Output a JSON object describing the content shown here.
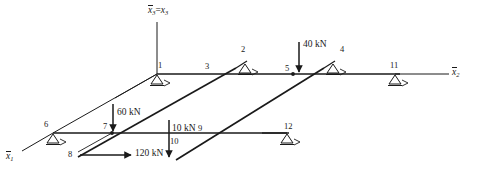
{
  "figure": {
    "type": "structural-frame-diagram",
    "background_color": "#ffffff",
    "line_color": "#1a1a1a",
    "width": 480,
    "height": 184
  },
  "axes": [
    {
      "id": "x1",
      "label": "x1",
      "overline": true,
      "equals": "",
      "x": 8,
      "y": 156,
      "direction": "down-left"
    },
    {
      "id": "x2",
      "label": "x2",
      "overline": true,
      "equals": "",
      "x": 457,
      "y": 70,
      "direction": "right"
    },
    {
      "id": "x3",
      "label": "x3 = x3",
      "overline": true,
      "equals": "= x3",
      "x": 148,
      "y": 7,
      "direction": "up"
    }
  ],
  "axis_text": {
    "x1_base": "x",
    "x1_sub": "1",
    "x2_base": "x",
    "x2_sub": "2",
    "x3_base": "x",
    "x3_sub": "3",
    "x3_eq": "=",
    "x3_rhs_base": "x",
    "x3_rhs_sub": "3"
  },
  "nodes": [
    {
      "id": "1",
      "label": "1",
      "lx": 158,
      "ly": 62,
      "nx": 157,
      "ny": 74,
      "support": "roller"
    },
    {
      "id": "2",
      "label": "2",
      "lx": 241,
      "ly": 46,
      "nx": 245,
      "ny": 63,
      "support": "roller"
    },
    {
      "id": "3",
      "label": "3",
      "lx": 206,
      "ly": 64,
      "nx": 207,
      "ny": 74,
      "support": "none"
    },
    {
      "id": "4",
      "label": "4",
      "lx": 341,
      "ly": 46,
      "nx": 333,
      "ny": 63,
      "support": "roller"
    },
    {
      "id": "5",
      "label": "5",
      "lx": 286,
      "ly": 65,
      "nx": 293,
      "ny": 74,
      "support": "none"
    },
    {
      "id": "6",
      "label": "6",
      "lx": 45,
      "ly": 122,
      "nx": 53,
      "ny": 133,
      "support": "roller"
    },
    {
      "id": "7",
      "label": "7",
      "lx": 104,
      "ly": 124,
      "nx": 112,
      "ny": 133,
      "support": "none"
    },
    {
      "id": "8",
      "label": "8",
      "lx": 69,
      "ly": 152,
      "nx": 78,
      "ny": 157,
      "support": "none"
    },
    {
      "id": "9",
      "label": "9",
      "lx": 199,
      "ly": 125,
      "nx": 202,
      "ny": 133,
      "support": "none"
    },
    {
      "id": "10",
      "label": "10",
      "lx": 171,
      "ly": 139,
      "nx": 172,
      "ny": 133,
      "support": "none"
    },
    {
      "id": "11",
      "label": "11",
      "lx": 392,
      "ly": 62,
      "nx": 395,
      "ny": 74,
      "support": "roller"
    },
    {
      "id": "12",
      "label": "12",
      "lx": 285,
      "ly": 123,
      "nx": 287,
      "ny": 133,
      "support": "roller"
    }
  ],
  "loads": [
    {
      "id": "load-40",
      "label": "40 kN",
      "value": 40,
      "unit": "kN",
      "direction": "down",
      "at_node": "5",
      "lx": 303,
      "ly": 41
    },
    {
      "id": "load-60",
      "label": "60 kN",
      "value": 60,
      "unit": "kN",
      "direction": "down",
      "at_node": "7",
      "lx": 118,
      "ly": 110
    },
    {
      "id": "load-10",
      "label": "10 kN",
      "value": 10,
      "unit": "kN",
      "direction": "down",
      "at_node": "10",
      "lx": 172,
      "ly": 127
    },
    {
      "id": "load-120",
      "label": "120 kN",
      "value": 120,
      "unit": "kN",
      "direction": "right",
      "at_node": "8",
      "lx": 136,
      "ly": 150
    }
  ],
  "members": {
    "upper_horizontal": {
      "from": [
        157,
        74
      ],
      "to": [
        445,
        74
      ]
    },
    "lower_horizontal": {
      "from": [
        53,
        133
      ],
      "to": [
        287,
        133
      ]
    },
    "diagonals": [
      {
        "from": [
          53,
          133
        ],
        "to": [
          157,
          74
        ]
      },
      {
        "from": [
          78,
          157
        ],
        "to": [
          245,
          63
        ]
      },
      {
        "from": [
          175,
          160
        ],
        "to": [
          341,
          62
        ]
      }
    ]
  },
  "supports": {
    "symbol": "roller-triangle",
    "count": 6,
    "nodes": [
      "1",
      "2",
      "4",
      "6",
      "11",
      "12"
    ]
  }
}
